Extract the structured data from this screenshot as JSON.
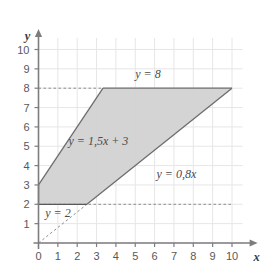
{
  "figure": {
    "background_color": "#ffffff"
  },
  "axes": {
    "x_axis_name": "x",
    "y_axis_name": "y",
    "x_ticks": [
      "0",
      "1",
      "2",
      "3",
      "4",
      "5",
      "6",
      "7",
      "8",
      "9",
      "10"
    ],
    "y_ticks": [
      "1",
      "2",
      "3",
      "4",
      "5",
      "6",
      "7",
      "8",
      "9",
      "10"
    ],
    "grid_color": "#e6e6e6",
    "axis_color": "#7d7d80",
    "tick_label_color": "#58585a"
  },
  "annotations": {
    "line_top": "y = 8",
    "line_upper_left": "y = 1,5x + 3",
    "line_lower_right": "y = 0,8x",
    "line_bottom": "y = 2"
  },
  "chart_data": {
    "type": "line",
    "title": "",
    "xlabel": "x",
    "ylabel": "y",
    "xlim": [
      0,
      10.5
    ],
    "ylim": [
      0,
      10.6
    ],
    "grid": true,
    "legend": "none",
    "x_ticks": [
      0,
      1,
      2,
      3,
      4,
      5,
      6,
      7,
      8,
      9,
      10
    ],
    "y_ticks": [
      1,
      2,
      3,
      4,
      5,
      6,
      7,
      8,
      9,
      10
    ],
    "series": [
      {
        "name": "y = 1,5x + 3",
        "equation": "y = 1.5x + 3",
        "slope": 1.5,
        "intercept": 3,
        "style": "solid",
        "color": "#6d6d70",
        "x": [
          0,
          3.3333
        ],
        "values": [
          3,
          8
        ]
      },
      {
        "name": "y = 8",
        "equation": "y = 8",
        "slope": 0,
        "intercept": 8,
        "style": "solid",
        "color": "#6d6d70",
        "x": [
          3.3333,
          10
        ],
        "values": [
          8,
          8
        ]
      },
      {
        "name": "y = 8 reference",
        "equation": "y = 8",
        "style": "dashed",
        "color": "#8c8c8f",
        "x": [
          0,
          3.3333
        ],
        "values": [
          8,
          8
        ]
      },
      {
        "name": "y = 0,8x",
        "equation": "y = 0.8x",
        "slope": 0.8,
        "intercept": 0,
        "style": "solid",
        "color": "#6d6d70",
        "x": [
          2.5,
          10
        ],
        "values": [
          2,
          8
        ]
      },
      {
        "name": "y = 0,8x extension",
        "equation": "y = 0.8x",
        "style": "dashed",
        "color": "#8c8c8f",
        "x": [
          0,
          2.5
        ],
        "values": [
          0,
          2
        ]
      },
      {
        "name": "y = 2",
        "equation": "y = 2",
        "slope": 0,
        "intercept": 2,
        "style": "dashed",
        "color": "#8c8c8f",
        "x": [
          0,
          10
        ],
        "values": [
          2,
          2
        ]
      }
    ],
    "shaded_region": {
      "name": "feasible-region",
      "fill_color": "#d2d2d2",
      "stroke_color": "#58585a",
      "vertices": [
        {
          "x": 0,
          "y": 3
        },
        {
          "x": 3.3333,
          "y": 8
        },
        {
          "x": 10,
          "y": 8
        },
        {
          "x": 2.5,
          "y": 2
        },
        {
          "x": 0,
          "y": 2
        }
      ],
      "constraints": [
        "y <= 1.5x + 3",
        "y <= 8",
        "y >= 0.8x",
        "y >= 2"
      ]
    },
    "label_positions": [
      {
        "text": "y = 8",
        "x": 5.0,
        "y": 8.75
      },
      {
        "text": "y = 1,5x + 3",
        "x": 1.55,
        "y": 5.25
      },
      {
        "text": "y = 0,8x",
        "x": 6.1,
        "y": 3.55
      },
      {
        "text": "y = 2",
        "x": 0.35,
        "y": 1.55
      }
    ]
  }
}
